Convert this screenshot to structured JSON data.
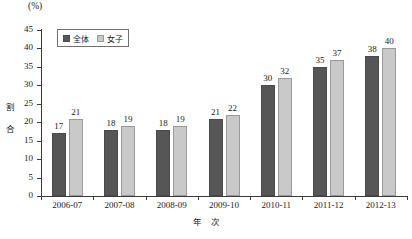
{
  "chart_data": {
    "type": "bar",
    "title": "",
    "unit_label": "(%)",
    "ylabel": "割合",
    "xlabel_parts": [
      "年",
      "次"
    ],
    "categories": [
      "2006-07",
      "2007-08",
      "2008-09",
      "2009-10",
      "2010-11",
      "2011-12",
      "2012-13"
    ],
    "series": [
      {
        "name": "全体",
        "color": "#565656",
        "values": [
          17,
          18,
          18,
          21,
          30,
          35,
          38
        ]
      },
      {
        "name": "女子",
        "color": "#c9c9c9",
        "values": [
          21,
          19,
          19,
          22,
          32,
          37,
          40
        ]
      }
    ],
    "ylim": [
      0,
      45
    ],
    "yticks": [
      0,
      5,
      10,
      15,
      20,
      25,
      30,
      35,
      40,
      45
    ],
    "grid": false,
    "legend_position": "top-left"
  }
}
